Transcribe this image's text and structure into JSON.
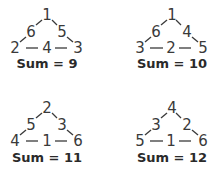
{
  "puzzles": [
    {
      "top": "1",
      "left_mid": "6",
      "right_mid": "5",
      "bottom_left": "2",
      "bottom_mid": "4",
      "bottom_right": "3",
      "sum_label": "Sum = 9"
    },
    {
      "top": "1",
      "left_mid": "6",
      "right_mid": "4",
      "bottom_left": "3",
      "bottom_mid": "2",
      "bottom_right": "5",
      "sum_label": "Sum = 10"
    },
    {
      "top": "2",
      "left_mid": "5",
      "right_mid": "3",
      "bottom_left": "4",
      "bottom_mid": "1",
      "bottom_right": "6",
      "sum_label": "Sum = 11"
    },
    {
      "top": "4",
      "left_mid": "3",
      "right_mid": "2",
      "bottom_left": "5",
      "bottom_mid": "1",
      "bottom_right": "6",
      "sum_label": "Sum = 12"
    }
  ],
  "colors": {
    "text": "#333333",
    "background": "#ffffff"
  }
}
